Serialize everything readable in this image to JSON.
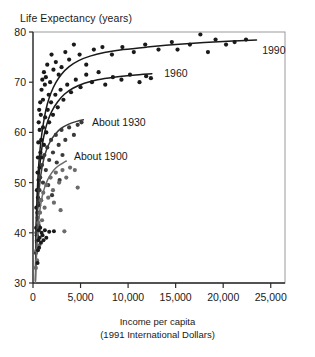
{
  "chart_data": {
    "type": "scatter",
    "title": "",
    "ylabel": "Life Expectancy (years)",
    "xlabel_line1": "Income per capita",
    "xlabel_line2": "(1991 International Dollars)",
    "xlim": [
      0,
      26500
    ],
    "ylim": [
      30,
      80
    ],
    "xticks": [
      0,
      5000,
      10000,
      15000,
      20000,
      25000
    ],
    "xticklabels": [
      "0",
      "5,000",
      "10,000",
      "15,000",
      "20,000",
      "25,000"
    ],
    "yticks": [
      30,
      40,
      50,
      60,
      70,
      80
    ],
    "yticklabels": [
      "30",
      "40",
      "50",
      "60",
      "70",
      "80"
    ],
    "grid": false,
    "legend_position": "inline-annotations",
    "series": [
      {
        "name": "1990",
        "label": "1990",
        "label_x": 24100,
        "label_y": 76.4,
        "color": "#1a1a1a",
        "curve": [
          [
            280,
            38.0
          ],
          [
            350,
            43.0
          ],
          [
            430,
            47.5
          ],
          [
            520,
            51.0
          ],
          [
            620,
            54.0
          ],
          [
            760,
            57.0
          ],
          [
            950,
            60.0
          ],
          [
            1200,
            63.0
          ],
          [
            1500,
            65.6
          ],
          [
            1900,
            67.9
          ],
          [
            2400,
            69.9
          ],
          [
            3000,
            71.6
          ],
          [
            3800,
            73.1
          ],
          [
            4800,
            74.3
          ],
          [
            6000,
            75.2
          ],
          [
            7500,
            75.9
          ],
          [
            9500,
            76.5
          ],
          [
            12000,
            77.0
          ],
          [
            15000,
            77.5
          ],
          [
            18000,
            77.9
          ],
          [
            21000,
            78.2
          ],
          [
            23500,
            78.4
          ]
        ],
        "points": [
          [
            350,
            45.0
          ],
          [
            420,
            48.5
          ],
          [
            480,
            52.0
          ],
          [
            520,
            55.0
          ],
          [
            560,
            58.0
          ],
          [
            600,
            62.0
          ],
          [
            650,
            64.5
          ],
          [
            700,
            60.5
          ],
          [
            760,
            66.0
          ],
          [
            820,
            63.5
          ],
          [
            900,
            68.5
          ],
          [
            980,
            70.5
          ],
          [
            1050,
            66.5
          ],
          [
            1150,
            72.0
          ],
          [
            1250,
            69.5
          ],
          [
            1350,
            71.0
          ],
          [
            1500,
            73.5
          ],
          [
            1650,
            67.5
          ],
          [
            1800,
            70.0
          ],
          [
            1950,
            75.5
          ],
          [
            2150,
            72.5
          ],
          [
            2400,
            74.0
          ],
          [
            2700,
            71.5
          ],
          [
            3000,
            73.0
          ],
          [
            3400,
            76.0
          ],
          [
            3800,
            74.5
          ],
          [
            4300,
            77.5
          ],
          [
            4900,
            75.5
          ],
          [
            5600,
            73.5
          ],
          [
            6400,
            76.5
          ],
          [
            7300,
            77.0
          ],
          [
            8300,
            75.5
          ],
          [
            9400,
            77.0
          ],
          [
            10600,
            76.0
          ],
          [
            11800,
            77.5
          ],
          [
            13200,
            76.5
          ],
          [
            14600,
            78.0
          ],
          [
            15200,
            76.5
          ],
          [
            16500,
            77.5
          ],
          [
            17600,
            79.5
          ],
          [
            18400,
            76.0
          ],
          [
            19200,
            78.5
          ],
          [
            20300,
            77.5
          ],
          [
            21200,
            78.0
          ],
          [
            22400,
            78.5
          ]
        ]
      },
      {
        "name": "1960",
        "label": "1960",
        "label_x": 13800,
        "label_y": 71.8,
        "color": "#1a1a1a",
        "curve": [
          [
            260,
            33.0
          ],
          [
            320,
            38.0
          ],
          [
            400,
            43.0
          ],
          [
            500,
            47.5
          ],
          [
            620,
            51.0
          ],
          [
            780,
            54.5
          ],
          [
            980,
            57.5
          ],
          [
            1250,
            60.2
          ],
          [
            1600,
            62.5
          ],
          [
            2000,
            64.3
          ],
          [
            2600,
            66.1
          ],
          [
            3300,
            67.6
          ],
          [
            4200,
            68.8
          ],
          [
            5400,
            69.8
          ],
          [
            6800,
            70.5
          ],
          [
            8500,
            71.0
          ],
          [
            10500,
            71.4
          ],
          [
            12500,
            71.7
          ]
        ],
        "points": [
          [
            330,
            41.0
          ],
          [
            400,
            39.5
          ],
          [
            460,
            44.0
          ],
          [
            520,
            47.0
          ],
          [
            580,
            50.5
          ],
          [
            640,
            45.5
          ],
          [
            700,
            53.0
          ],
          [
            780,
            56.0
          ],
          [
            860,
            58.5
          ],
          [
            950,
            55.0
          ],
          [
            1050,
            61.0
          ],
          [
            1150,
            57.5
          ],
          [
            1280,
            63.0
          ],
          [
            1400,
            60.0
          ],
          [
            1550,
            64.5
          ],
          [
            1700,
            62.0
          ],
          [
            1900,
            66.0
          ],
          [
            2100,
            63.5
          ],
          [
            2350,
            67.5
          ],
          [
            2600,
            65.0
          ],
          [
            2900,
            68.5
          ],
          [
            3200,
            66.5
          ],
          [
            3600,
            69.5
          ],
          [
            4000,
            68.0
          ],
          [
            4500,
            70.5
          ],
          [
            5000,
            69.0
          ],
          [
            5600,
            71.5
          ],
          [
            6200,
            70.0
          ],
          [
            6900,
            72.0
          ],
          [
            7600,
            69.5
          ],
          [
            8400,
            71.0
          ],
          [
            9300,
            70.5
          ],
          [
            10200,
            71.5
          ],
          [
            11200,
            70.0
          ],
          [
            11900,
            71.2
          ],
          [
            12400,
            70.8
          ]
        ]
      },
      {
        "name": "About 1930",
        "label": "About 1930",
        "label_x": 6200,
        "label_y": 62.0,
        "color": "#3a3a3a",
        "curve": [
          [
            250,
            30.5
          ],
          [
            300,
            35.0
          ],
          [
            370,
            39.5
          ],
          [
            460,
            43.5
          ],
          [
            570,
            47.0
          ],
          [
            720,
            50.0
          ],
          [
            900,
            52.5
          ],
          [
            1150,
            54.8
          ],
          [
            1450,
            56.7
          ],
          [
            1850,
            58.3
          ],
          [
            2350,
            59.7
          ],
          [
            2950,
            60.8
          ],
          [
            3700,
            61.6
          ],
          [
            4600,
            62.2
          ],
          [
            5300,
            62.5
          ]
        ],
        "points": [
          [
            300,
            36.0
          ],
          [
            360,
            40.0
          ],
          [
            420,
            38.5
          ],
          [
            480,
            43.0
          ],
          [
            540,
            46.0
          ],
          [
            600,
            41.5
          ],
          [
            680,
            48.5
          ],
          [
            760,
            51.0
          ],
          [
            850,
            46.5
          ],
          [
            950,
            53.5
          ],
          [
            1050,
            50.0
          ],
          [
            1200,
            55.5
          ],
          [
            1350,
            52.5
          ],
          [
            1500,
            57.0
          ],
          [
            1700,
            54.5
          ],
          [
            1900,
            58.5
          ],
          [
            2100,
            56.0
          ],
          [
            2400,
            59.5
          ],
          [
            2700,
            57.5
          ],
          [
            3000,
            60.5
          ],
          [
            3400,
            58.5
          ],
          [
            3800,
            61.0
          ],
          [
            4300,
            59.5
          ],
          [
            4700,
            61.5
          ],
          [
            5100,
            62.0
          ],
          [
            2500,
            54.0
          ],
          [
            3100,
            55.5
          ],
          [
            1600,
            49.5
          ],
          [
            2000,
            47.5
          ],
          [
            2800,
            50.5
          ]
        ]
      },
      {
        "name": "About 1900",
        "label": "About 1900",
        "label_x": 4300,
        "label_y": 55.2,
        "color": "#6b6b6b",
        "curve": [
          [
            250,
            30.0
          ],
          [
            300,
            32.5
          ],
          [
            380,
            36.0
          ],
          [
            480,
            39.5
          ],
          [
            600,
            42.5
          ],
          [
            760,
            45.0
          ],
          [
            960,
            47.2
          ],
          [
            1220,
            49.0
          ],
          [
            1550,
            50.6
          ],
          [
            1950,
            51.9
          ],
          [
            2450,
            53.0
          ],
          [
            3050,
            53.8
          ],
          [
            3500,
            54.3
          ]
        ],
        "points": [
          [
            300,
            33.0
          ],
          [
            360,
            36.5
          ],
          [
            430,
            34.5
          ],
          [
            500,
            39.0
          ],
          [
            570,
            42.0
          ],
          [
            650,
            37.5
          ],
          [
            740,
            44.0
          ],
          [
            840,
            46.5
          ],
          [
            950,
            42.5
          ],
          [
            1080,
            48.0
          ],
          [
            1220,
            45.0
          ],
          [
            1400,
            49.5
          ],
          [
            1600,
            47.0
          ],
          [
            1850,
            51.0
          ],
          [
            2100,
            48.5
          ],
          [
            2400,
            52.0
          ],
          [
            2750,
            50.0
          ],
          [
            3100,
            52.5
          ],
          [
            3500,
            51.0
          ],
          [
            3900,
            53.0
          ],
          [
            4400,
            52.5
          ],
          [
            2900,
            44.5
          ],
          [
            3300,
            40.3
          ],
          [
            4700,
            49.0
          ],
          [
            2200,
            46.0
          ]
        ]
      }
    ],
    "extra_points": [
      [
        480,
        34.0
      ],
      [
        520,
        36.5
      ],
      [
        560,
        38.5
      ],
      [
        600,
        40.5
      ],
      [
        640,
        37.0
      ],
      [
        700,
        39.0
      ],
      [
        760,
        41.0
      ],
      [
        840,
        38.0
      ],
      [
        900,
        40.0
      ],
      [
        1000,
        39.5
      ],
      [
        1100,
        38.5
      ],
      [
        1250,
        40.5
      ],
      [
        1400,
        39.0
      ],
      [
        1700,
        40.2
      ],
      [
        2200,
        40.3
      ]
    ]
  }
}
